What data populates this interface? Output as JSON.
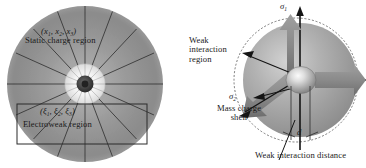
{
  "figure": {
    "kind": "two-panel scientific schematic",
    "background_color": "#ffffff",
    "width_px": 366,
    "height_px": 168
  },
  "palette": {
    "disc_outer_gray": "#8e8e8e",
    "disc_mid_gray": "#9b9b9b",
    "disc_inner_light": "#d8d8d8",
    "spoke_line": "#2b2b2b",
    "core_dark": "#3a3a3a",
    "ring_white": "#f2f2f2",
    "sphere_gray": "#9a9a9a",
    "sphere_highlight": "#e8e8e8",
    "arrow_gray": "#8a8a8a",
    "arrow_gray_dark": "#6f6f6f",
    "axis_black": "#141414",
    "box_stroke": "#2b2b2b",
    "dashed_stroke": "#5a5a5a",
    "text_color": "#1a1a1a"
  },
  "left_panel": {
    "name": "static charge region diagram",
    "coord_label": "(x",
    "coord_label_full": "(x1, x2, x3)",
    "coord_sub_1": "1",
    "coord_sub_2": "2",
    "coord_sub_3": "3",
    "coord_sep": ", x",
    "coord_close": ")",
    "region_label": "Static charge region",
    "inner_coord_sym": "(ξ",
    "inner_coord_full": "(ξ1, ξ2, ξ3)",
    "inner_sub_1": "1",
    "inner_sub_2": "2",
    "inner_sub_3": "3",
    "inner_sep": ", ξ",
    "inner_close": ")",
    "inner_region_label": "Electroweak region",
    "spoke_count": 18,
    "has_inner_ring": true,
    "has_rect_box": true
  },
  "right_panel": {
    "name": "mass charge shell diagram",
    "sigma_1_sym": "σ",
    "sigma_1_sub": "1",
    "sigma_2_sym": "σ",
    "sigma_2_sub": "2",
    "weak_interaction_region_label": "Weak interaction region",
    "mass_charge_shell_label": "Mass charge shell",
    "weak_interaction_distance_label": "Weak interaction distance",
    "distance_marker": "d",
    "arrow_count": 5,
    "has_dashed_boundary": true
  }
}
